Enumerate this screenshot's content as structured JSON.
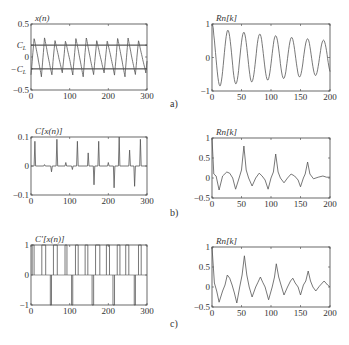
{
  "figure": {
    "row_labels": [
      "a)",
      "b)",
      "c)"
    ]
  },
  "chart_data": [
    {
      "id": "a-left",
      "type": "line",
      "title": "x(n)",
      "xlabel": "",
      "ylabel": "",
      "xlim": [
        0,
        300
      ],
      "ylim": [
        -0.5,
        0.5
      ],
      "xticks": [
        0,
        100,
        200,
        300
      ],
      "yticks": [
        {
          "v": 0.5,
          "label": "0.5"
        },
        {
          "v": 0.18,
          "label": "C_L"
        },
        {
          "v": 0,
          "label": "0"
        },
        {
          "v": -0.18,
          "label": "-C_L"
        },
        {
          "v": -0.5,
          "label": "-0.5"
        }
      ],
      "hlines": [
        0.18,
        -0.18
      ],
      "grid": false,
      "series": [
        {
          "name": "x(n)",
          "generator": "sawtooth",
          "period": 27,
          "amp": 0.3,
          "n": 300
        }
      ]
    },
    {
      "id": "a-right",
      "type": "line",
      "title": "Rn[k]",
      "xlim": [
        0,
        200
      ],
      "ylim": [
        -1,
        1
      ],
      "xticks": [
        0,
        50,
        100,
        150,
        200
      ],
      "yticks": [
        {
          "v": 1,
          "label": "1"
        },
        {
          "v": 0,
          "label": "0"
        },
        {
          "v": -1,
          "label": "-1"
        }
      ],
      "grid": false,
      "series": [
        {
          "name": "Rn[k]",
          "generator": "damped_cos",
          "period": 27,
          "decay": 0.0028,
          "n": 200
        }
      ]
    },
    {
      "id": "b-left",
      "type": "line",
      "title": "C[x(n)]",
      "xlim": [
        0,
        300
      ],
      "ylim": [
        -0.1,
        0.1
      ],
      "xticks": [
        0,
        100,
        200,
        300
      ],
      "yticks": [
        {
          "v": 0.1,
          "label": "0.1"
        },
        {
          "v": 0,
          "label": "0"
        },
        {
          "v": -0.1,
          "label": "-0.1"
        }
      ],
      "grid": false,
      "spikes": [
        [
          10,
          0.085
        ],
        [
          35,
          0.005
        ],
        [
          53,
          -0.02
        ],
        [
          67,
          0.092
        ],
        [
          90,
          0.012
        ],
        [
          107,
          -0.012
        ],
        [
          120,
          0.085
        ],
        [
          148,
          0.045
        ],
        [
          163,
          -0.065
        ],
        [
          175,
          0.085
        ],
        [
          200,
          0.012
        ],
        [
          215,
          -0.075
        ],
        [
          228,
          0.1
        ],
        [
          255,
          0.055
        ],
        [
          268,
          -0.07
        ],
        [
          283,
          0.092
        ]
      ]
    },
    {
      "id": "b-right",
      "type": "line",
      "title": "Rn[k]",
      "xlim": [
        0,
        200
      ],
      "ylim": [
        -0.5,
        1
      ],
      "xticks": [
        0,
        50,
        100,
        150,
        200
      ],
      "yticks": [
        {
          "v": 1,
          "label": "1"
        },
        {
          "v": 0.5,
          "label": "0.5"
        },
        {
          "v": 0,
          "label": "0"
        },
        {
          "v": -0.5,
          "label": "-0.5"
        }
      ],
      "grid": false,
      "points": [
        [
          0,
          1
        ],
        [
          3,
          0.1
        ],
        [
          7,
          0.05
        ],
        [
          12,
          -0.3
        ],
        [
          18,
          0.05
        ],
        [
          25,
          0.15
        ],
        [
          30,
          0.12
        ],
        [
          35,
          0
        ],
        [
          40,
          -0.28
        ],
        [
          46,
          0
        ],
        [
          50,
          0.2
        ],
        [
          54,
          0.8
        ],
        [
          58,
          0.2
        ],
        [
          62,
          0
        ],
        [
          68,
          -0.2
        ],
        [
          74,
          0
        ],
        [
          80,
          0.12
        ],
        [
          85,
          0.05
        ],
        [
          90,
          -0.05
        ],
        [
          95,
          -0.28
        ],
        [
          100,
          0
        ],
        [
          104,
          0.15
        ],
        [
          108,
          0.6
        ],
        [
          112,
          0.15
        ],
        [
          116,
          0
        ],
        [
          122,
          -0.12
        ],
        [
          128,
          0
        ],
        [
          134,
          0.1
        ],
        [
          140,
          0.05
        ],
        [
          146,
          -0.05
        ],
        [
          150,
          -0.22
        ],
        [
          155,
          0
        ],
        [
          158,
          0.1
        ],
        [
          162,
          0.4
        ],
        [
          166,
          0.1
        ],
        [
          172,
          -0.02
        ],
        [
          180,
          0.02
        ],
        [
          188,
          0.05
        ],
        [
          194,
          0.02
        ],
        [
          200,
          0.02
        ]
      ]
    },
    {
      "id": "c-left",
      "type": "step",
      "title": "C'[x(n)]",
      "xlim": [
        0,
        300
      ],
      "ylim": [
        -1,
        1
      ],
      "xticks": [
        0,
        100,
        200,
        300
      ],
      "yticks": [
        {
          "v": 1,
          "label": "1"
        },
        {
          "v": 0,
          "label": "0"
        },
        {
          "v": -1,
          "label": "-1"
        }
      ],
      "grid": false,
      "pulses_up": [
        [
          3,
          8
        ],
        [
          28,
          38
        ],
        [
          58,
          68
        ],
        [
          88,
          93
        ],
        [
          115,
          122
        ],
        [
          140,
          147
        ],
        [
          167,
          178
        ],
        [
          195,
          203
        ],
        [
          223,
          230
        ],
        [
          245,
          253
        ],
        [
          278,
          285
        ]
      ],
      "pulses_down": [
        [
          50,
          53
        ],
        [
          105,
          108
        ],
        [
          158,
          162
        ],
        [
          212,
          216
        ],
        [
          267,
          270
        ]
      ]
    },
    {
      "id": "c-right",
      "type": "line",
      "title": "Rn[k]",
      "xlim": [
        0,
        200
      ],
      "ylim": [
        -0.5,
        1
      ],
      "xticks": [
        0,
        50,
        100,
        150,
        200
      ],
      "yticks": [
        {
          "v": 1,
          "label": "1"
        },
        {
          "v": 0.5,
          "label": "0.5"
        },
        {
          "v": 0,
          "label": "0"
        },
        {
          "v": -0.5,
          "label": "-0.5"
        }
      ],
      "grid": false,
      "points": [
        [
          0,
          1
        ],
        [
          4,
          0.1
        ],
        [
          8,
          -0.1
        ],
        [
          12,
          -0.38
        ],
        [
          18,
          -0.1
        ],
        [
          22,
          0.05
        ],
        [
          26,
          0.3
        ],
        [
          30,
          0.22
        ],
        [
          34,
          0.05
        ],
        [
          38,
          -0.15
        ],
        [
          42,
          -0.4
        ],
        [
          47,
          0
        ],
        [
          51,
          0.3
        ],
        [
          55,
          0.78
        ],
        [
          59,
          0.3
        ],
        [
          63,
          0
        ],
        [
          68,
          -0.25
        ],
        [
          74,
          0
        ],
        [
          78,
          0.12
        ],
        [
          82,
          0.25
        ],
        [
          86,
          0.12
        ],
        [
          90,
          0
        ],
        [
          96,
          -0.32
        ],
        [
          102,
          0
        ],
        [
          106,
          0.25
        ],
        [
          109,
          0.58
        ],
        [
          113,
          0.25
        ],
        [
          118,
          0
        ],
        [
          122,
          -0.2
        ],
        [
          128,
          0
        ],
        [
          133,
          0.15
        ],
        [
          137,
          0.22
        ],
        [
          141,
          0.1
        ],
        [
          146,
          0
        ],
        [
          150,
          -0.2
        ],
        [
          155,
          0.05
        ],
        [
          159,
          0.15
        ],
        [
          163,
          0.4
        ],
        [
          167,
          0.15
        ],
        [
          171,
          0
        ],
        [
          176,
          -0.1
        ],
        [
          182,
          0.02
        ],
        [
          190,
          0.15
        ],
        [
          196,
          0.05
        ],
        [
          200,
          0
        ]
      ]
    }
  ]
}
